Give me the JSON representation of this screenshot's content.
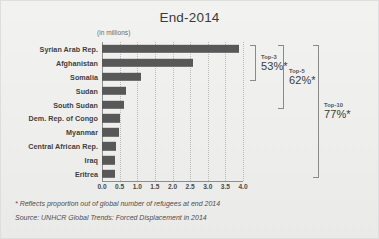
{
  "title": "End-2014",
  "axis_unit_label": "(in millions)",
  "footnotes": {
    "asterisk": "* Reflects proportion out of global number of refugees at end 2014",
    "source": "Source: UNHCR Global Trends: Forced Displacement in 2014"
  },
  "brackets": [
    {
      "rank": "Top-3",
      "pct": "53%*",
      "from_row": 0,
      "to_row": 2
    },
    {
      "rank": "Top-5",
      "pct": "62%*",
      "from_row": 0,
      "to_row": 4
    },
    {
      "rank": "Top-10",
      "pct": "77%*",
      "from_row": 0,
      "to_row": 9
    }
  ],
  "colors": {
    "bar": "#585858",
    "background": "#eeeeec",
    "grid": "#b9b9b9",
    "axis": "#8e8e8e",
    "text": "#3b3b3b"
  },
  "chart_data": {
    "type": "bar",
    "orientation": "horizontal",
    "title": "End-2014",
    "xlabel": "(in millions)",
    "ylabel": "",
    "xlim": [
      0.0,
      4.0
    ],
    "grid": true,
    "legend": "none",
    "xticks": [
      "0.0",
      "0.5",
      "1.0",
      "1.5",
      "2.0",
      "2.5",
      "3.0",
      "3.5",
      "4.0"
    ],
    "xtick_values": [
      0.0,
      0.5,
      1.0,
      1.5,
      2.0,
      2.5,
      3.0,
      3.5,
      4.0
    ],
    "categories": [
      "Syrian Arab Rep.",
      "Afghanistan",
      "Somalia",
      "Sudan",
      "South Sudan",
      "Dem. Rep. of Congo",
      "Myanmar",
      "Central African Rep.",
      "Iraq",
      "Eritrea"
    ],
    "values": [
      3.88,
      2.59,
      1.11,
      0.67,
      0.62,
      0.52,
      0.48,
      0.41,
      0.37,
      0.36
    ],
    "annotations": [
      "Top-3 53%*",
      "Top-5 62%*",
      "Top-10 77%*"
    ]
  }
}
